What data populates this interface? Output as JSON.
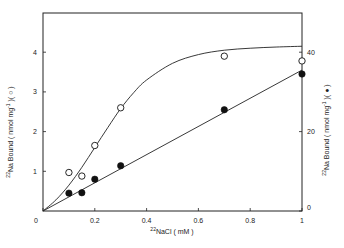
{
  "chart_data": {
    "type": "scatter",
    "title": "",
    "xlabel": "22NaCl ( mM )",
    "xlabel_sup": "22",
    "xlabel_main": "NaCl  ( mM )",
    "ylabel_left": "22Na Bound ( nmol mg-1 )( ○ )",
    "ylabel_left_sup": "22",
    "ylabel_left_main": "Na Bound  ( nmol mg",
    "ylabel_left_tail": " )( ○ )",
    "ylabel_right": "22Na Bound ( nmol mg-1 )( ● )",
    "ylabel_right_sup": "22",
    "ylabel_right_main": "Na Bound  ( nmol mg",
    "ylabel_right_tail": " )( ● )",
    "xlim": [
      0,
      1
    ],
    "ylim_left": [
      0,
      5
    ],
    "ylim_right": [
      0,
      50
    ],
    "x_ticks": [
      "0",
      "0.2",
      "0.4",
      "0.6",
      "0.8",
      "1"
    ],
    "x_tick_values": [
      0,
      0.2,
      0.4,
      0.6,
      0.8,
      1
    ],
    "y_left_ticks": [
      "0",
      "1",
      "2",
      "3",
      "4"
    ],
    "y_left_tick_values": [
      0,
      1,
      2,
      3,
      4
    ],
    "y_right_ticks": [
      "0",
      "20",
      "40"
    ],
    "y_right_tick_values": [
      0,
      20,
      40
    ],
    "grid": false,
    "legend": "none (symbols indicated in axis labels)",
    "series": [
      {
        "name": "open circles (left axis)",
        "marker": "open-circle",
        "axis": "left",
        "x": [
          0.1,
          0.15,
          0.2,
          0.3,
          0.7,
          1.0
        ],
        "values": [
          0.97,
          0.88,
          1.65,
          2.6,
          3.9,
          3.78
        ],
        "fit": "sigmoidal saturation curve",
        "fit_x": [
          0,
          0.05,
          0.1,
          0.15,
          0.2,
          0.25,
          0.3,
          0.35,
          0.4,
          0.5,
          0.6,
          0.7,
          0.8,
          0.9,
          1.0
        ],
        "fit_y": [
          0,
          0.28,
          0.65,
          1.1,
          1.6,
          2.1,
          2.58,
          2.98,
          3.3,
          3.72,
          3.94,
          4.05,
          4.1,
          4.13,
          4.15
        ]
      },
      {
        "name": "filled circles (right axis)",
        "marker": "filled-circle",
        "axis": "right",
        "x": [
          0.1,
          0.15,
          0.2,
          0.3,
          0.7,
          1.0
        ],
        "values": [
          4.5,
          4.6,
          8.0,
          11.4,
          25.5,
          34.5
        ],
        "fit": "linear",
        "fit_x": [
          0,
          1.0
        ],
        "fit_y": [
          0,
          35.5
        ]
      }
    ]
  }
}
